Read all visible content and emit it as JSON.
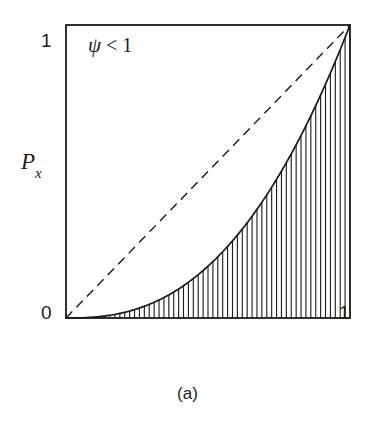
{
  "figure": {
    "caption": "(a)",
    "annotation": {
      "symbol": "ψ",
      "relation": " < 1",
      "full_text": "ψ < 1"
    },
    "axes": {
      "ylabel_main": "P",
      "ylabel_sub": "x",
      "ylabel_full": "P_x",
      "xlabel": "",
      "y_tick_top": "1",
      "origin_tick": "0",
      "x_tick_right": "1"
    },
    "colors": {
      "frame": "#1a1a1a",
      "curve": "#1a1a1a",
      "dashed": "#1a1a1a",
      "hatch": "#1a1a1a",
      "background": "#ffffff"
    }
  },
  "chart_data": {
    "type": "line",
    "title": "",
    "subtitle": "",
    "xlabel": "",
    "ylabel": "P_x",
    "xlim": [
      0,
      1
    ],
    "ylim": [
      0,
      1
    ],
    "grid": false,
    "legend": null,
    "legend_position": "none",
    "annotations": [
      {
        "text": "ψ < 1",
        "x": 0.08,
        "y": 0.94
      },
      {
        "text": "(a)",
        "x": 0.5,
        "y": -0.24
      }
    ],
    "xticks": [
      0,
      1
    ],
    "xticklabels": [
      "0",
      "1"
    ],
    "yticks": [
      0,
      1
    ],
    "yticklabels": [
      "0",
      "1"
    ],
    "series": [
      {
        "name": "P_x (psi < 1)",
        "style": "solid",
        "exponent": 2.5,
        "x": [
          0,
          0.05,
          0.1,
          0.15,
          0.2,
          0.25,
          0.3,
          0.35,
          0.4,
          0.45,
          0.5,
          0.55,
          0.6,
          0.65,
          0.7,
          0.75,
          0.8,
          0.85,
          0.9,
          0.95,
          1
        ],
        "values": [
          0,
          0.0006,
          0.0032,
          0.0087,
          0.0179,
          0.0313,
          0.0493,
          0.0724,
          0.1012,
          0.1358,
          0.1768,
          0.2243,
          0.2789,
          0.3406,
          0.4099,
          0.4871,
          0.5724,
          0.6662,
          0.7687,
          0.8801,
          1
        ]
      },
      {
        "name": "reference diagonal",
        "style": "dashed",
        "exponent": 1,
        "x": [
          0,
          1
        ],
        "values": [
          0,
          1
        ]
      }
    ],
    "fill": {
      "between": "P_x (psi < 1) and y=0",
      "pattern": "vertical-hatch",
      "hatch_count": 58
    }
  }
}
